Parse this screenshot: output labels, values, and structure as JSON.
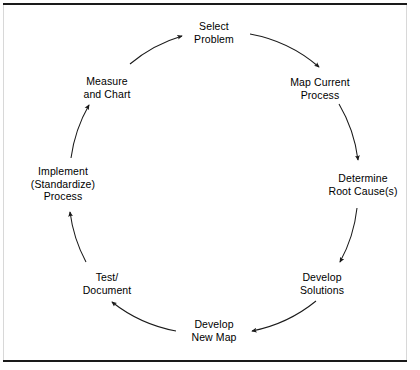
{
  "figure": {
    "direction": "clockwise",
    "line_color": "#1a1a1a",
    "text_color": "#000000",
    "background_color": "#ffffff",
    "border_color": "#1a1a1a"
  },
  "nodes": [
    {
      "id": "select-problem",
      "label": "Select\nProblem",
      "lines": [
        "Select",
        "Problem"
      ],
      "position": "top",
      "x": 214,
      "y": 32
    },
    {
      "id": "map-current-process",
      "label": "Map Current\nProcess",
      "lines": [
        "Map Current",
        "Process"
      ],
      "position": "upper-right",
      "x": 320,
      "y": 88
    },
    {
      "id": "determine-root-causes",
      "label": "Determine\nRoot Cause(s)",
      "lines": [
        "Determine",
        "Root Cause(s)"
      ],
      "position": "right",
      "x": 363,
      "y": 184
    },
    {
      "id": "develop-solutions",
      "label": "Develop\nSolutions",
      "lines": [
        "Develop",
        "Solutions"
      ],
      "position": "lower-right",
      "x": 322,
      "y": 283
    },
    {
      "id": "develop-new-map",
      "label": "Develop\nNew Map",
      "lines": [
        "Develop",
        "New Map"
      ],
      "position": "bottom",
      "x": 214,
      "y": 330
    },
    {
      "id": "test-document",
      "label": "Test/\nDocument",
      "lines": [
        "Test/",
        "Document"
      ],
      "position": "lower-left",
      "x": 107,
      "y": 283
    },
    {
      "id": "implement-standardize-process",
      "label": "Implement\n(Standardize)\nProcess",
      "lines": [
        "Implement",
        "(Standardize)",
        "Process"
      ],
      "position": "left",
      "x": 63,
      "y": 184
    },
    {
      "id": "measure-and-chart",
      "label": "Measure\nand Chart",
      "lines": [
        "Measure",
        "and Chart"
      ],
      "position": "upper-left",
      "x": 107,
      "y": 87
    }
  ],
  "connections": [
    {
      "from": "select-problem",
      "to": "map-current-process"
    },
    {
      "from": "map-current-process",
      "to": "determine-root-causes"
    },
    {
      "from": "determine-root-causes",
      "to": "develop-solutions"
    },
    {
      "from": "develop-solutions",
      "to": "develop-new-map"
    },
    {
      "from": "develop-new-map",
      "to": "test-document"
    },
    {
      "from": "test-document",
      "to": "implement-standardize-process"
    },
    {
      "from": "implement-standardize-process",
      "to": "measure-and-chart"
    },
    {
      "from": "measure-and-chart",
      "to": "select-problem"
    }
  ]
}
